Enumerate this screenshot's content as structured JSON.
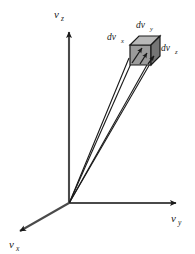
{
  "figure": {
    "type": "velocity-space-volume-element-diagram",
    "background_color": "#ffffff",
    "axes": {
      "z": {
        "main": "v",
        "sub": "z",
        "full": "vz",
        "direction": "vertical-up"
      },
      "y": {
        "main": "v",
        "sub": "y",
        "full": "vy",
        "direction": "horizontal-right"
      },
      "x": {
        "main": "v",
        "sub": "x",
        "full": "vx",
        "direction": "diagonal-down-left"
      }
    },
    "volume_element": {
      "labels": {
        "dvx": {
          "main": "dv",
          "sub": "x",
          "full": "dvx",
          "position": "left"
        },
        "dvy": {
          "main": "dv",
          "sub": "y",
          "full": "dvy",
          "position": "top"
        },
        "dvz": {
          "main": "dv",
          "sub": "z",
          "full": "dvz",
          "position": "right"
        }
      },
      "fill_front": "#9c9c9c",
      "fill_top": "#b5b5b5",
      "fill_side": "#6e6e6e",
      "stroke": "#1a1a1a"
    },
    "ray_lines": {
      "count": 3,
      "color": "#1a1a1a",
      "origin_label": "origin"
    },
    "stroke_color": "#3a3a3a"
  }
}
